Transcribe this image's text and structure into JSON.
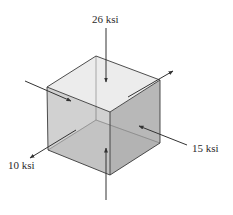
{
  "diagram": {
    "type": "stress-element-cube",
    "colors": {
      "top_face": "#ececec",
      "left_face": "#c9c9c9",
      "right_face": "#b3b3b3",
      "bottom_face": "#a9a9a9",
      "edge": "#3a3a3a",
      "arrow": "#333333",
      "background": "#ffffff"
    },
    "labels": {
      "top": "26 ksi",
      "right": "15 ksi",
      "left": "10 ksi"
    },
    "stresses": [
      {
        "label": "26 ksi",
        "axis": "vertical",
        "direction": "compressive (toward faces)"
      },
      {
        "label": "15 ksi",
        "axis": "right-diagonal",
        "direction": "compressive (toward faces)"
      },
      {
        "label": "10 ksi",
        "axis": "left-diagonal",
        "direction": "tensile (away from faces)"
      }
    ]
  }
}
